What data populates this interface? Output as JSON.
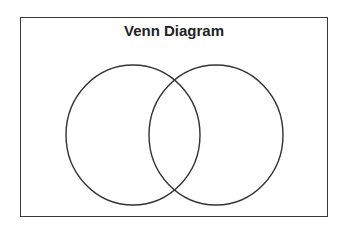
{
  "diagram": {
    "title": "Venn Diagram",
    "type": "venn",
    "sets": [
      {
        "name": "set-a",
        "label": ""
      },
      {
        "name": "set-b",
        "label": ""
      }
    ],
    "stroke_color": "#333333",
    "background": "#ffffff"
  }
}
